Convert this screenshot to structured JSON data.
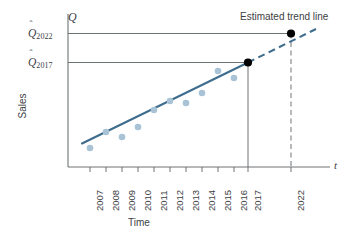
{
  "chart_data": {
    "type": "scatter",
    "title": "",
    "xlabel": "Time",
    "ylabel": "Sales",
    "x_axis_symbol": "t",
    "y_axis_symbol": "Q",
    "grid": false,
    "legend_position": "none",
    "categories": [
      "2007",
      "2008",
      "2009",
      "2010",
      "2011",
      "2012",
      "2013",
      "2014",
      "2015",
      "2016",
      "2017",
      "2022"
    ],
    "tick_labels": [
      "2007",
      "2008",
      "2009",
      "2010",
      "2011",
      "2012",
      "2013",
      "2014",
      "2015",
      "2016",
      "2017",
      "2022"
    ],
    "series": [
      {
        "name": "Observed sales",
        "type": "scatter",
        "color": "#a9c3d6",
        "x": [
          "2007",
          "2008",
          "2009",
          "2010",
          "2011",
          "2012",
          "2013",
          "2014",
          "2015",
          "2016"
        ],
        "values": [
          18,
          33,
          28,
          38,
          52,
          56,
          51,
          62,
          73,
          67
        ]
      },
      {
        "name": "Estimated trend line",
        "type": "line",
        "style": "solid",
        "color": "#3f6d8e",
        "x": [
          "2007",
          "2017"
        ],
        "values": [
          22,
          76
        ]
      },
      {
        "name": "Forecast extension",
        "type": "line",
        "style": "dashed",
        "color": "#3f6d8e",
        "x": [
          "2017",
          "2022"
        ],
        "values": [
          76,
          100
        ]
      }
    ],
    "forecast_points": [
      {
        "label": "Q-hat 2017",
        "x": "2017",
        "value": 76,
        "color": "#000000"
      },
      {
        "label": "Q-hat 2022",
        "x": "2022",
        "value": 100,
        "color": "#000000"
      }
    ],
    "reference_lines": [
      {
        "label": "Q-hat 2022",
        "orientation": "horizontal",
        "value": 100,
        "style": "solid"
      },
      {
        "label": "Q-hat 2017",
        "orientation": "horizontal",
        "value": 76,
        "style": "solid"
      },
      {
        "label": "2017",
        "orientation": "vertical",
        "value": "2017",
        "style": "solid"
      },
      {
        "label": "2022",
        "orientation": "vertical",
        "value": "2022",
        "style": "dashed"
      }
    ],
    "ylim": [
      0,
      115
    ],
    "annotations": [
      {
        "text": "Estimated trend line",
        "target": "forecast-extension"
      }
    ]
  },
  "labels": {
    "y_tick_2022_symbol": "Q",
    "y_tick_2022_sub": "2022",
    "y_tick_2017_symbol": "Q",
    "y_tick_2017_sub": "2017",
    "y_axis_symbol": "Q",
    "x_axis_symbol": "t",
    "y_axis_title": "Sales",
    "x_axis_title": "Time",
    "trend_annotation": "Estimated trend line"
  },
  "colors": {
    "point_fill": "#a9c3d6",
    "trend_line": "#3f6d8e",
    "axis": "#6e7376",
    "reference_line": "#6e7376",
    "forecast_marker": "#000000",
    "text": "#3d4043",
    "background": "#ffffff"
  }
}
